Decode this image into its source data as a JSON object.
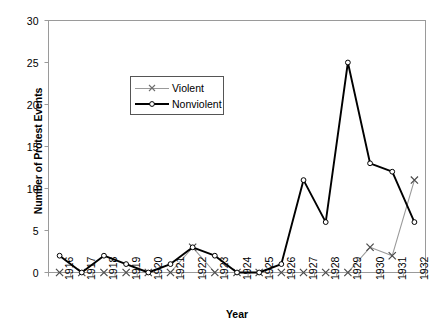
{
  "chart_data": {
    "type": "line",
    "title": "",
    "xlabel": "Year",
    "ylabel": "Number of Protest Events",
    "categories": [
      "1916",
      "1917",
      "1918",
      "1919",
      "1920",
      "1921",
      "1922",
      "1923",
      "1924",
      "1925",
      "1926",
      "1927",
      "1928",
      "1929",
      "1930",
      "1931",
      "1932"
    ],
    "ylim": [
      0,
      30
    ],
    "yticks": [
      0,
      5,
      10,
      15,
      20,
      25,
      30
    ],
    "grid": false,
    "legend_position": "upper-center-left",
    "series": [
      {
        "name": "Violent",
        "color": "#9a9a9a",
        "marker": "x",
        "values": [
          0,
          0,
          0,
          0,
          0,
          0,
          3,
          0,
          0,
          0,
          0,
          0,
          0,
          0,
          3,
          2,
          11
        ]
      },
      {
        "name": "Nonviolent",
        "color": "#000000",
        "marker": "circle",
        "values": [
          2,
          0,
          2,
          1,
          0,
          1,
          3,
          2,
          0,
          0,
          1,
          11,
          6,
          25,
          13,
          12,
          6
        ]
      }
    ]
  },
  "axis": {
    "ytick_labels": [
      "0",
      "5",
      "10",
      "15",
      "20",
      "25",
      "30"
    ],
    "xtick_labels": [
      "1916",
      "1917",
      "1918",
      "1919",
      "1920",
      "1921",
      "1922",
      "1923",
      "1924",
      "1925",
      "1926",
      "1927",
      "1928",
      "1929",
      "1930",
      "1931",
      "1932"
    ]
  },
  "legend": {
    "items": [
      {
        "label": "Violent"
      },
      {
        "label": "Nonviolent"
      }
    ]
  },
  "labels": {
    "y_axis_title": "Number of Protest Events",
    "x_axis_title": "Year"
  }
}
